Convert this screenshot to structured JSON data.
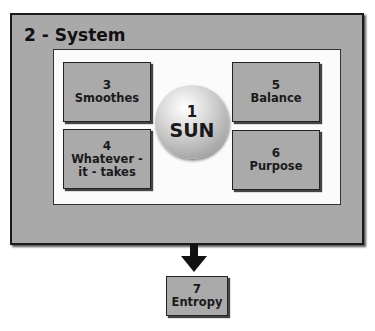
{
  "system": {
    "title": "2 - System"
  },
  "center": {
    "number": "1",
    "label": "SUN"
  },
  "boxes": [
    {
      "number": "3",
      "label": "Smoothes"
    },
    {
      "number": "4",
      "label": "Whatever -\nit - takes"
    },
    {
      "number": "5",
      "label": "Balance"
    },
    {
      "number": "6",
      "label": "Purpose"
    }
  ],
  "output": {
    "number": "7",
    "label": "Entropy"
  },
  "colors": {
    "box_fill": "#aaaaaa",
    "panel_fill": "#a9a9a9",
    "inner_fill": "#fbfbfb",
    "border": "#1a1a1a"
  }
}
